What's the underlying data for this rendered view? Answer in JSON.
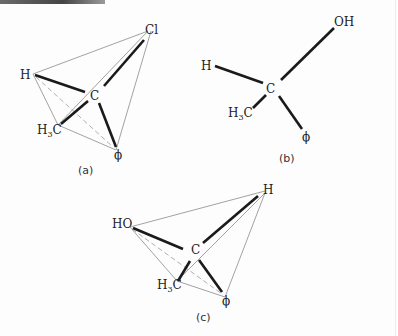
{
  "figures": [
    {
      "id": "a",
      "caption": "(a)",
      "center": "C",
      "substituents": [
        "Cl",
        "H",
        "H3C",
        "ϕ"
      ],
      "tetrahedron_edges": true
    },
    {
      "id": "b",
      "caption": "(b)",
      "center": "C",
      "substituents": [
        "OH",
        "H",
        "H3C",
        "ϕ"
      ],
      "tetrahedron_edges": false
    },
    {
      "id": "c",
      "caption": "(c)",
      "center": "C",
      "substituents": [
        "H",
        "HO",
        "H3C",
        "ϕ"
      ],
      "tetrahedron_edges": true
    }
  ],
  "labels": {
    "a_cl": "Cl",
    "a_h": "H",
    "a_c": "C",
    "a_h3c_main": "H",
    "a_h3c_sub": "3",
    "a_h3c_c": "C",
    "a_phi": "ϕ",
    "a_caption": "(a)",
    "b_oh": "OH",
    "b_h": "H",
    "b_c": "C",
    "b_h3c_main": "H",
    "b_h3c_sub": "3",
    "b_h3c_c": "C",
    "b_phi": "ϕ",
    "b_caption": "(b)",
    "c_h": "H",
    "c_ho": "HO",
    "c_c": "C",
    "c_h3c_main": "H",
    "c_h3c_sub": "3",
    "c_h3c_c": "C",
    "c_phi": "ϕ",
    "c_caption": "(c)"
  }
}
